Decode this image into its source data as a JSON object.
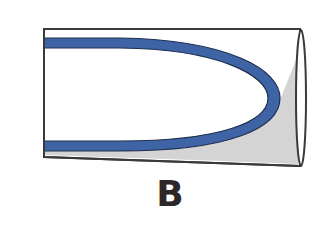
{
  "figure": {
    "label": "B",
    "colors": {
      "background": "#ffffff",
      "outline": "#3a3a3a",
      "blue_band": "#3e64a6",
      "blue_band_edge": "#1f2f4e",
      "shading": "#d4d4d4",
      "tube_inner": "#ffffff",
      "label": "#2f2628"
    },
    "parts": [
      "tube-body",
      "blue-u-band",
      "shaded-wedge",
      "open-end-ellipse"
    ]
  }
}
